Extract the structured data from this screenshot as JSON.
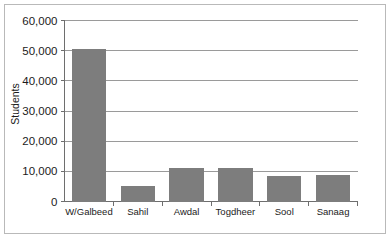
{
  "chart_data": {
    "type": "bar",
    "title": "",
    "xlabel": "",
    "ylabel": "Students",
    "categories": [
      "W/Galbeed",
      "Sahil",
      "Awdal",
      "Togdheer",
      "Sool",
      "Sanaag"
    ],
    "values": [
      50700,
      5000,
      11100,
      11100,
      8300,
      8700
    ],
    "ylim": [
      0,
      60000
    ],
    "ytick_values": [
      0,
      10000,
      20000,
      30000,
      40000,
      50000,
      60000
    ],
    "ytick_labels": [
      "0",
      "10,000",
      "20,000",
      "30,000",
      "40,000",
      "50,000",
      "60,000"
    ],
    "grid": true,
    "legend": false,
    "legend_position": "none",
    "bar_color": "#7d7d7d",
    "gridline_color": "#9a9a9a",
    "axis_color": "#6e6e6e",
    "background_color": "#ffffff",
    "border_color": "#b9b9b9"
  }
}
